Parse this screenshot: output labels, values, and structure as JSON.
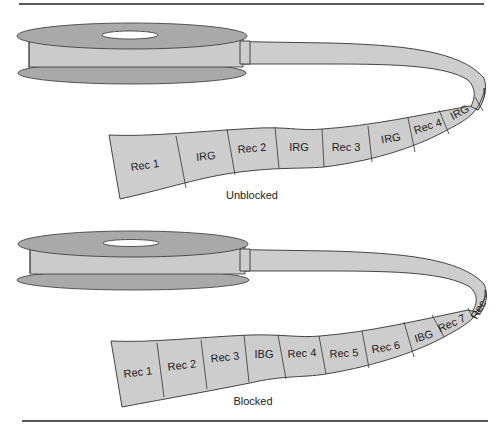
{
  "figure": {
    "diagrams": [
      {
        "id": "unblocked",
        "caption": "Unblocked",
        "segments": [
          "Rec 1",
          "IRG",
          "Rec 2",
          "IRG",
          "Rec 3",
          "IRG",
          "Rec 4",
          "IRG"
        ]
      },
      {
        "id": "blocked",
        "caption": "Blocked",
        "segments": [
          "Rec 1",
          "Rec 2",
          "Rec 3",
          "IBG",
          "Rec 4",
          "Rec 5",
          "Rec 6",
          "IBG",
          "Rec 7",
          "Rec"
        ]
      }
    ],
    "colors": {
      "flange": "#a9a9a9",
      "tape": "#cdcdcd",
      "outline": "#333333"
    }
  }
}
